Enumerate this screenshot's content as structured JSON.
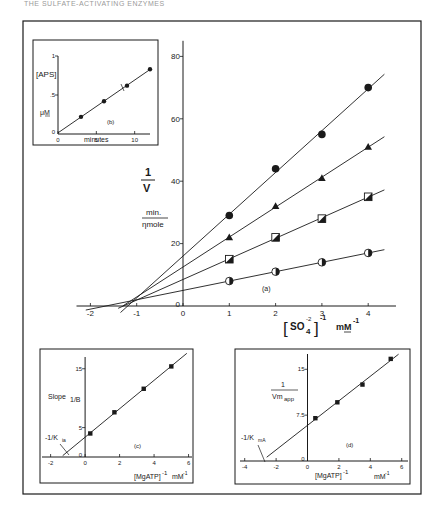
{
  "header": {
    "text": "THE SULFATE-ACTIVATING ENZYMES"
  },
  "chart_data": [
    {
      "id": "a",
      "type": "line",
      "panel_label": "(a)",
      "title": "",
      "xlabel": "[SO4^2-]^-1  mM^-1",
      "xlabel_parts": {
        "bracket": "SO4",
        "sup": "-2",
        "exp": "-1",
        "unit": "mM",
        "unit_exp": "-1"
      },
      "ylabel": "1/V",
      "ylabel_parts": {
        "num": "1",
        "den": "V",
        "unit_num": "min.",
        "unit_den": "ηmole"
      },
      "xlim": [
        -2.3,
        4.6
      ],
      "ylim": [
        0,
        85
      ],
      "x_ticks": [
        -2,
        -1,
        0,
        1,
        2,
        3,
        4
      ],
      "x_tick_labels": [
        "-2",
        "-1",
        "0",
        "1",
        "2",
        "3",
        "4"
      ],
      "y_ticks": [
        0,
        20,
        40,
        60,
        80
      ],
      "y_tick_labels": [
        "0",
        "20",
        "40",
        "60",
        "80"
      ],
      "grid": false,
      "legend": null,
      "x": [
        1,
        2,
        3,
        4
      ],
      "series": [
        {
          "name": "filled circles",
          "marker": "circle-filled",
          "values": [
            29,
            44,
            55,
            70
          ],
          "intercept_y": 15,
          "x_intercept": -1.35
        },
        {
          "name": "filled triangles",
          "marker": "triangle-filled",
          "values": [
            22,
            32,
            41,
            51
          ],
          "intercept_y": 12,
          "x_intercept": -1.3
        },
        {
          "name": "half-filled squares",
          "marker": "square-half",
          "values": [
            15,
            22,
            28,
            35
          ],
          "intercept_y": 9,
          "x_intercept": -1.4
        },
        {
          "name": "half-filled circles",
          "marker": "circle-half",
          "values": [
            8,
            11,
            14,
            17
          ],
          "intercept_y": 5,
          "x_intercept": -2.1
        }
      ],
      "annotations": [
        "lines converge near x = -0.9, y ≈ 3"
      ]
    },
    {
      "id": "b",
      "type": "line",
      "panel_label": "(b)",
      "xlabel": "minutes",
      "ylabel": "[APS] μM",
      "ylabel_parts": {
        "top": "[APS]",
        "bottom": "μM"
      },
      "xlim": [
        0,
        12
      ],
      "ylim": [
        0,
        1
      ],
      "x_ticks": [
        0,
        5,
        10
      ],
      "x_tick_labels": [
        "0",
        "5",
        "10"
      ],
      "y_ticks": [
        0,
        0.5,
        1
      ],
      "y_tick_labels": [
        "0",
        ".5",
        "1"
      ],
      "grid": false,
      "x": [
        3,
        6,
        9,
        12
      ],
      "series": [
        {
          "name": "APS formed",
          "marker": "circle-filled",
          "values": [
            0.22,
            0.42,
            0.62,
            0.83
          ]
        }
      ],
      "annotations": [
        "arrow pointing to point near 9 min"
      ]
    },
    {
      "id": "c",
      "type": "line",
      "panel_label": "(c)",
      "xlabel": "[MgATP]^-1  mM^-1",
      "ylabel": "Slope 1/B",
      "xlim": [
        -2.5,
        6.2
      ],
      "ylim": [
        0,
        17
      ],
      "x_ticks": [
        -2,
        0,
        2,
        4,
        6
      ],
      "x_tick_labels": [
        "-2",
        "0",
        "2",
        "4",
        "6"
      ],
      "y_ticks": [
        0,
        5,
        15
      ],
      "y_tick_labels": [
        "0",
        "5",
        "15"
      ],
      "grid": false,
      "x": [
        0.3,
        1.7,
        3.4,
        5.0
      ],
      "series": [
        {
          "name": "slopes",
          "marker": "square-filled",
          "values": [
            4.0,
            7.6,
            11.6,
            15.4
          ],
          "x_intercept": -1.3
        }
      ],
      "annotations": [
        "-1/Kia"
      ]
    },
    {
      "id": "d",
      "type": "line",
      "panel_label": "(d)",
      "xlabel": "[MgATP]^-1  mM^-1",
      "ylabel": "1/Vm_app",
      "xlim": [
        -4.3,
        6.4
      ],
      "ylim": [
        0,
        17.5
      ],
      "x_ticks": [
        -4,
        -2,
        0,
        2,
        4,
        6
      ],
      "x_tick_labels": [
        "-4",
        "-2",
        "0",
        "2",
        "4",
        "6"
      ],
      "y_ticks": [
        0,
        7.5,
        15
      ],
      "y_tick_labels": [
        "0",
        "7.5",
        "15"
      ],
      "grid": false,
      "x": [
        0.5,
        1.9,
        3.5,
        5.3
      ],
      "series": [
        {
          "name": "1/Vm app",
          "marker": "square-filled",
          "values": [
            7.0,
            9.6,
            12.5,
            16.7
          ],
          "x_intercept": -2.6
        }
      ],
      "annotations": [
        "-1/KmA"
      ]
    }
  ],
  "labels": {
    "a_panel": "(a)",
    "b_panel": "(b)",
    "c_panel": "(c)",
    "d_panel": "(d)",
    "a_y_num": "1",
    "a_y_den": "V",
    "a_unit_num": "min.",
    "a_unit_den": "ηmole",
    "a_x_bracket": "SO",
    "a_x_sub": "4",
    "a_x_sup": "-2",
    "a_x_exp": "-1",
    "a_x_unit": "mM",
    "a_x_unit_exp": "-1",
    "b_y_top": "[APS]",
    "b_y_mid": ".5",
    "b_y_bottom": "μM",
    "b_x_label": "minutes",
    "c_y_label": "Slope",
    "c_y_sub": "1/B",
    "c_intercept": "-1/K",
    "c_intercept_sub": "ia",
    "d_y_num": "1",
    "d_y_den": "Vm",
    "d_y_den_sub": "app",
    "d_intercept": "-1/K",
    "d_intercept_sub": "mA",
    "mg_x_label": "[MgATP]",
    "mg_x_exp": "-1",
    "mg_x_unit": "mM",
    "mg_x_unit_exp": "-1"
  }
}
